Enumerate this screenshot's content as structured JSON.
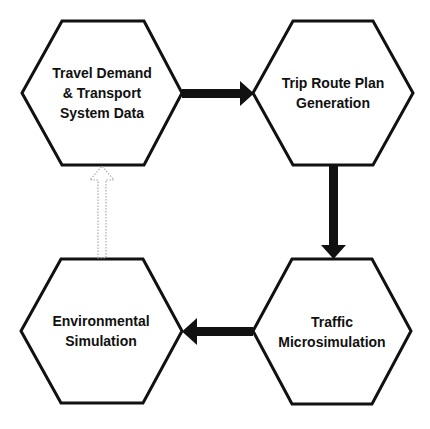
{
  "diagram": {
    "type": "flowchart",
    "colors": {
      "stroke": "#111111",
      "fill": "#ffffff",
      "dotted_arrow": "#a8a8a8"
    },
    "nodes": [
      {
        "id": "travel-demand",
        "lines": [
          "Travel Demand",
          "& Transport",
          "System Data"
        ],
        "center": [
          102,
          93
        ]
      },
      {
        "id": "trip-route",
        "lines": [
          "Trip Route Plan",
          "Generation"
        ],
        "center": [
          333,
          93
        ]
      },
      {
        "id": "traffic-micro",
        "lines": [
          "Traffic",
          "Microsimulation"
        ],
        "center": [
          332,
          331
        ]
      },
      {
        "id": "environmental",
        "lines": [
          "Environmental",
          "Simulation"
        ],
        "center": [
          101,
          331
        ]
      }
    ],
    "edges": [
      {
        "from": "travel-demand",
        "to": "trip-route",
        "style": "solid-thick"
      },
      {
        "from": "trip-route",
        "to": "traffic-micro",
        "style": "solid-thick"
      },
      {
        "from": "traffic-micro",
        "to": "environmental",
        "style": "solid-thick"
      },
      {
        "from": "environmental",
        "to": "travel-demand",
        "style": "dotted-outline"
      }
    ]
  }
}
